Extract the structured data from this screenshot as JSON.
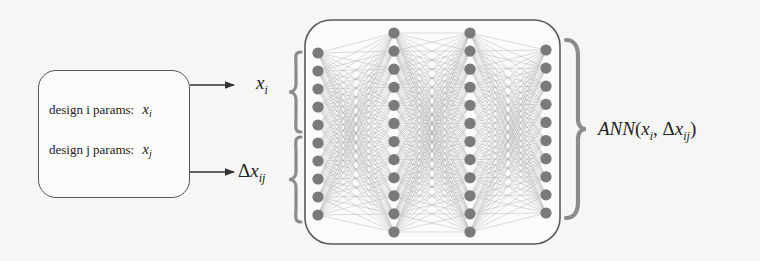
{
  "diagram": {
    "input_box": {
      "row_i": {
        "label": "design i params:",
        "symbol": "x",
        "sub": "i"
      },
      "row_j": {
        "label": "design j params:",
        "symbol": "x",
        "sub": "j"
      }
    },
    "arrow_labels": {
      "top": {
        "symbol": "x",
        "sub": "i"
      },
      "bottom": {
        "delta": "Δ",
        "symbol": "x",
        "sub": "ij"
      }
    },
    "network": {
      "layers": [
        {
          "x": 318,
          "nodes": 10,
          "y_start": 53,
          "y_end": 215
        },
        {
          "x": 394,
          "nodes": 12,
          "y_start": 33,
          "y_end": 232
        },
        {
          "x": 470,
          "nodes": 12,
          "y_start": 33,
          "y_end": 232
        },
        {
          "x": 546,
          "nodes": 10,
          "y_start": 50,
          "y_end": 213
        }
      ],
      "node_color": "#7a7a7a",
      "edge_color": "#9a9a9a"
    },
    "output_label": {
      "func": "ANN",
      "open": "(",
      "arg1_symbol": "x",
      "arg1_sub": "i",
      "comma": ", ",
      "delta": "Δ",
      "arg2_symbol": "x",
      "arg2_sub": "ij",
      "close": ")"
    },
    "colors": {
      "brace": "#8c8c8c",
      "line": "#333333",
      "box_border": "#555555"
    }
  }
}
